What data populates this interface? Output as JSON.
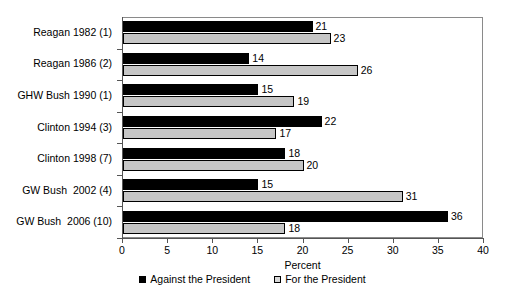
{
  "chart_data": {
    "type": "bar",
    "orientation": "horizontal",
    "title": "",
    "xlabel": "Percent",
    "ylabel": "",
    "xlim": [
      0,
      40
    ],
    "xticks": [
      0,
      5,
      10,
      15,
      20,
      25,
      30,
      35,
      40
    ],
    "grid": false,
    "legend_position": "bottom-center",
    "categories": [
      "Reagan 1982 (1)",
      "Reagan 1986 (2)",
      "GHW Bush 1990 (1)",
      "Clinton 1994 (3)",
      "Clinton 1998 (7)",
      "GW Bush  2002 (4)",
      "GW Bush  2006 (10)"
    ],
    "series": [
      {
        "name": "Against the President",
        "color": "#000000",
        "values": [
          21,
          14,
          15,
          22,
          18,
          15,
          36
        ]
      },
      {
        "name": "For the President",
        "color": "#c6c6c6",
        "values": [
          23,
          26,
          19,
          17,
          20,
          31,
          18
        ]
      }
    ]
  },
  "axis": {
    "x_title": "Percent",
    "tick_labels": [
      "0",
      "5",
      "10",
      "15",
      "20",
      "25",
      "30",
      "35",
      "40"
    ]
  },
  "legend": {
    "items": [
      {
        "label": "Against the President",
        "swatch": "filled-black-square"
      },
      {
        "label": "For the President",
        "swatch": "outlined-gray-square"
      }
    ]
  }
}
